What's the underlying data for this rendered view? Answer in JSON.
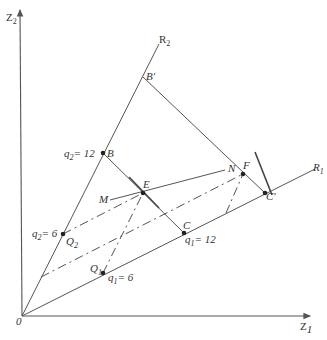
{
  "diagram": {
    "axes": {
      "x_label": "Z",
      "x_sub": "1",
      "y_label": "Z",
      "y_sub": "2",
      "origin": "0"
    },
    "rays": {
      "r1_label": "R",
      "r1_sub": "1",
      "r2_label": "R",
      "r2_sub": "2"
    },
    "points": {
      "B": "B",
      "B_prime": "B'",
      "C": "C",
      "C_prime": "C'",
      "E": "E",
      "F": "F",
      "M": "M",
      "N": "N",
      "Q1": "Q",
      "Q1_sub": "1",
      "Q2": "Q",
      "Q2_sub": "2"
    },
    "annotations": {
      "q2_12": "q",
      "q2_12_sub": "2",
      "q2_12_val": "= 12",
      "q2_6": "q",
      "q2_6_sub": "2",
      "q2_6_val": "= 6",
      "q1_12": "q",
      "q1_12_sub": "1",
      "q1_12_val": "= 12",
      "q1_6": "q",
      "q1_6_sub": "1",
      "q1_6_val": "= 6"
    }
  }
}
